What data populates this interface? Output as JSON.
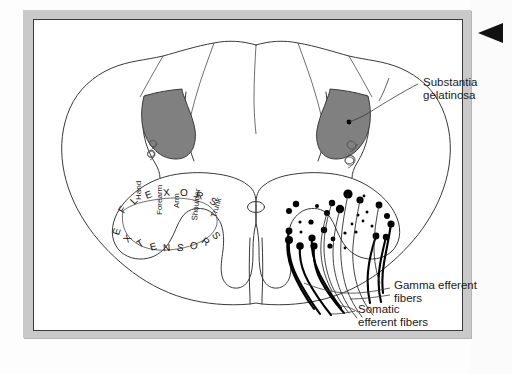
{
  "figure": {
    "type": "anatomical-diagram",
    "frame_color": "#c9c9c9",
    "outline_color": "#3a3a3a",
    "shaded_region_color": "#808080",
    "neuron_color": "#000000"
  },
  "labels": {
    "substantia_gelatinosa": {
      "line1": "Substantia",
      "line2": "gelatinosa"
    },
    "gamma_efferent": {
      "line1": "Gamma efferent",
      "line2": "fibers"
    },
    "somatic_efferent": {
      "line1": "Somatic",
      "line2": "efferent fibers"
    }
  },
  "somatotopic_map": {
    "outer_arc_word": "FLEXORS",
    "outer_arc_letters": [
      "F",
      "L",
      "E",
      "X",
      "O",
      "R",
      "S"
    ],
    "inner_arc_word": "EXTENSORS",
    "inner_arc_letters": [
      "E",
      "X",
      "T",
      "E",
      "N",
      "S",
      "O",
      "R",
      "S"
    ],
    "body_parts": [
      "Hand",
      "Forearm",
      "Arm",
      "Shoulder",
      "Trunk"
    ]
  },
  "markers": {
    "edge_triangle": "left-pointing-triangle"
  }
}
